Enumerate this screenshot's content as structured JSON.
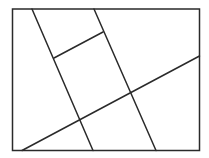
{
  "diagram": {
    "width": 209,
    "height": 158,
    "background": "#ffffff",
    "stroke_color": "#2a2a2a",
    "stroke_width": 1.5,
    "frame": {
      "x": 12.5,
      "y": 9,
      "w": 187,
      "h": 141.5
    },
    "segments": [
      {
        "name": "left-slanted-line",
        "x1": 32,
        "y1": 9,
        "x2": 93,
        "y2": 150.5
      },
      {
        "name": "right-slanted-line",
        "x1": 94,
        "y1": 9,
        "x2": 156,
        "y2": 150.5
      },
      {
        "name": "short-cross-segment",
        "x1": 54,
        "y1": 58,
        "x2": 103,
        "y2": 32
      },
      {
        "name": "long-diagonal-line",
        "x1": 22,
        "y1": 150.5,
        "x2": 199.5,
        "y2": 56
      }
    ]
  }
}
